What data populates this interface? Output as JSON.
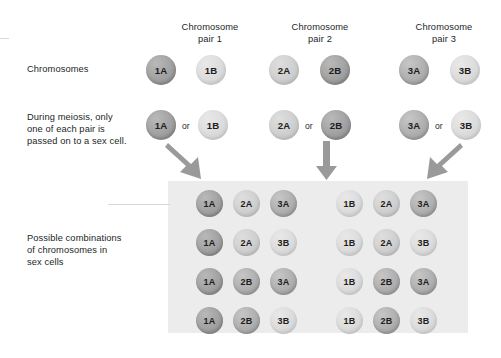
{
  "diagram": {
    "column_headers": [
      {
        "line1": "Chromosome",
        "line2": "pair 1"
      },
      {
        "line1": "Chromosome",
        "line2": "pair 2"
      },
      {
        "line1": "Chromosome",
        "line2": "pair 3"
      }
    ],
    "row_labels": {
      "chromosomes": "Chromosomes",
      "meiosis": "During meiosis, only one of each pair is passed on to a sex cell.",
      "meiosis_lines": [
        "During meiosis, only",
        "one of each pair is",
        "passed on to a sex cell."
      ],
      "combinations": "Possible combinations of chromosomes in sex cells",
      "combinations_lines": [
        "Possible combinations",
        "of chromosomes in",
        "sex cells"
      ]
    },
    "connector_word": "or",
    "chromosome_row": [
      {
        "label": "1A",
        "tone": "dark"
      },
      {
        "label": "1B",
        "tone": "pale"
      },
      {
        "label": "2A",
        "tone": "light"
      },
      {
        "label": "2B",
        "tone": "dark"
      },
      {
        "label": "3A",
        "tone": "mid"
      },
      {
        "label": "3B",
        "tone": "pale"
      }
    ],
    "meiosis_row": [
      {
        "label": "1A",
        "tone": "dark"
      },
      {
        "label": "1B",
        "tone": "pale"
      },
      {
        "label": "2A",
        "tone": "light"
      },
      {
        "label": "2B",
        "tone": "dark"
      },
      {
        "label": "3A",
        "tone": "mid"
      },
      {
        "label": "3B",
        "tone": "pale"
      }
    ],
    "arrows": [
      {
        "name": "arrow-pair-1",
        "direction": "down-right"
      },
      {
        "name": "arrow-pair-2",
        "direction": "down"
      },
      {
        "name": "arrow-pair-3",
        "direction": "down-left"
      }
    ],
    "combinations_grid": {
      "columns": 2,
      "rows": 4,
      "total_combinations": 8,
      "left_group": [
        [
          {
            "label": "1A",
            "tone": "dark"
          },
          {
            "label": "2A",
            "tone": "light"
          },
          {
            "label": "3A",
            "tone": "mid"
          }
        ],
        [
          {
            "label": "1A",
            "tone": "dark"
          },
          {
            "label": "2A",
            "tone": "light"
          },
          {
            "label": "3B",
            "tone": "pale"
          }
        ],
        [
          {
            "label": "1A",
            "tone": "dark"
          },
          {
            "label": "2B",
            "tone": "mid"
          },
          {
            "label": "3A",
            "tone": "mid"
          }
        ],
        [
          {
            "label": "1A",
            "tone": "dark"
          },
          {
            "label": "2B",
            "tone": "mid"
          },
          {
            "label": "3B",
            "tone": "pale"
          }
        ]
      ],
      "right_group": [
        [
          {
            "label": "1B",
            "tone": "pale"
          },
          {
            "label": "2A",
            "tone": "light"
          },
          {
            "label": "3A",
            "tone": "mid"
          }
        ],
        [
          {
            "label": "1B",
            "tone": "pale"
          },
          {
            "label": "2A",
            "tone": "light"
          },
          {
            "label": "3B",
            "tone": "pale"
          }
        ],
        [
          {
            "label": "1B",
            "tone": "pale"
          },
          {
            "label": "2B",
            "tone": "mid"
          },
          {
            "label": "3A",
            "tone": "mid"
          }
        ],
        [
          {
            "label": "1B",
            "tone": "pale"
          },
          {
            "label": "2B",
            "tone": "mid"
          },
          {
            "label": "3B",
            "tone": "pale"
          }
        ]
      ]
    },
    "colors": {
      "panel_background": "#ececec",
      "arrow_fill": "#9a9a9a",
      "text": "#221f1f",
      "page_background": "#ffffff"
    }
  }
}
